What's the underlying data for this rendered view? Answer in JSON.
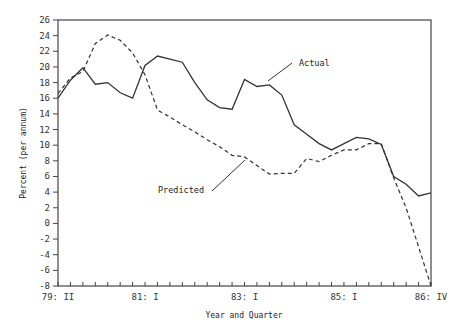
{
  "chart_data": {
    "type": "line",
    "title": "",
    "xlabel": "Year and Quarter",
    "ylabel": "Percent (per annum)",
    "ylim": [
      -8,
      26
    ],
    "yticks": [
      -8,
      -6,
      -4,
      -2,
      0,
      2,
      4,
      6,
      8,
      10,
      12,
      14,
      16,
      18,
      20,
      22,
      24,
      26
    ],
    "xtick_labels": [
      {
        "index": 0,
        "label": "79: II"
      },
      {
        "index": 7,
        "label": "81: I"
      },
      {
        "index": 15,
        "label": "83: I"
      },
      {
        "index": 23,
        "label": "85: I"
      },
      {
        "index": 30,
        "label": "86: IV"
      }
    ],
    "x": [
      "79:II",
      "79:III",
      "79:IV",
      "80:I",
      "80:II",
      "80:III",
      "80:IV",
      "81:I",
      "81:II",
      "81:III",
      "81:IV",
      "82:I",
      "82:II",
      "82:III",
      "82:IV",
      "83:I",
      "83:II",
      "83:III",
      "83:IV",
      "84:I",
      "84:II",
      "84:III",
      "84:IV",
      "85:I",
      "85:II",
      "85:III",
      "85:IV",
      "86:I",
      "86:II",
      "86:III",
      "86:IV"
    ],
    "series": [
      {
        "name": "Actual",
        "style": "solid",
        "values": [
          16.0,
          18.3,
          19.9,
          17.8,
          18.0,
          16.7,
          16.0,
          20.2,
          21.4,
          21.0,
          20.6,
          18.0,
          15.8,
          14.8,
          14.6,
          18.4,
          17.5,
          17.7,
          16.4,
          12.6,
          11.4,
          10.2,
          9.4,
          10.2,
          11.0,
          10.8,
          10.1,
          6.0,
          5.0,
          3.5,
          3.9
        ]
      },
      {
        "name": "Predicted",
        "style": "dashed",
        "values": [
          16.6,
          18.6,
          19.4,
          23.0,
          24.1,
          23.4,
          21.8,
          19.0,
          14.5,
          13.6,
          12.6,
          11.7,
          10.7,
          9.8,
          8.7,
          8.5,
          7.4,
          6.3,
          6.4,
          6.4,
          8.3,
          7.9,
          8.7,
          9.4,
          9.4,
          10.2,
          10.2,
          5.8,
          2.0,
          -3.0,
          -8.0
        ]
      }
    ],
    "annotations": [
      {
        "text": "Actual",
        "series": "Actual"
      },
      {
        "text": "Predicted",
        "series": "Predicted"
      }
    ],
    "grid": false,
    "legend": "inline annotations"
  }
}
